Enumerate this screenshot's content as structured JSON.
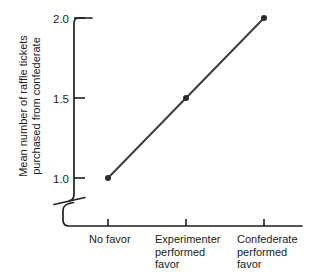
{
  "figure": {
    "y_axis_title": "Mean number of raffle tickets\npurchased from confederate"
  },
  "chart_data": {
    "type": "line",
    "title": "",
    "xlabel": "",
    "ylabel": "Mean number of raffle tickets purchased from confederate",
    "categories": [
      "No favor",
      "Experimenter performed favor",
      "Confederate performed favor"
    ],
    "series": [
      {
        "name": "Mean raffle tickets purchased from confederate",
        "values": [
          1.0,
          1.5,
          2.0
        ]
      }
    ],
    "yticks": [
      1.0,
      1.5,
      2.0
    ],
    "ytick_labels": [
      "1.0",
      "1.5",
      "2.0"
    ],
    "ylim": [
      1.0,
      2.0
    ],
    "axis_break": true,
    "grid": false,
    "legend": "none",
    "marker": "filled-circle",
    "colors": {
      "line": "#3d3d3d",
      "marker": "#2b2b2b",
      "axis": "#1f1f1f",
      "text": "#1c1c1c",
      "background": "#ffffff"
    }
  }
}
